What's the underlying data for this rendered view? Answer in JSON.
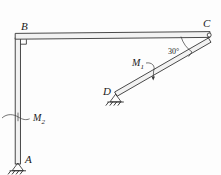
{
  "figure": {
    "background_color": "#fdfdfd",
    "line_color": "#2a2a2a",
    "labels": {
      "point_a": "A",
      "point_b": "B",
      "point_c": "C",
      "point_d": "D",
      "moment_1": "M",
      "moment_1_sub": "1",
      "moment_2": "M",
      "moment_2_sub": "2",
      "angle_c": "30°"
    },
    "geometry": {
      "point_a": {
        "x": 18,
        "y": 163
      },
      "point_b": {
        "x": 18,
        "y": 38
      },
      "point_c": {
        "x": 210,
        "y": 36
      },
      "point_d": {
        "x": 116,
        "y": 95
      },
      "angle_at_c_degrees": 30,
      "right_angle_at_b": true
    },
    "supports": [
      {
        "name": "pin-support-a",
        "at": "A",
        "type": "pin-with-hatching"
      },
      {
        "name": "pin-support-d",
        "at": "D",
        "type": "pin-with-hatching"
      }
    ],
    "joints": [
      {
        "name": "joint-c",
        "at": "C",
        "type": "pin"
      }
    ],
    "members": [
      {
        "name": "column-ab",
        "from": "A",
        "to": "B",
        "style": "double-line"
      },
      {
        "name": "beam-bc",
        "from": "B",
        "to": "C",
        "style": "double-line"
      },
      {
        "name": "strut-dc",
        "from": "D",
        "to": "C",
        "style": "double-line"
      }
    ],
    "moments": [
      {
        "name": "moment-m1",
        "label": "M1",
        "applied_to": "strut-dc"
      },
      {
        "name": "moment-m2",
        "label": "M2",
        "applied_to": "column-ab"
      }
    ]
  }
}
